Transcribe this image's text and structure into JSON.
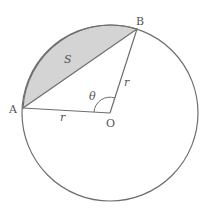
{
  "diagram": {
    "labels": {
      "A": "A",
      "B": "B",
      "O": "O",
      "S": "S",
      "theta": "θ",
      "r_OA": "r",
      "r_OB": "r"
    },
    "colors": {
      "stroke": "#6e6e6e",
      "segment_fill": "#d4d4d4",
      "background": "#ffffff"
    },
    "geometry": {
      "center": [
        110,
        113
      ],
      "radius": 88,
      "point_A": [
        23,
        108
      ],
      "point_B": [
        137,
        29
      ]
    }
  }
}
